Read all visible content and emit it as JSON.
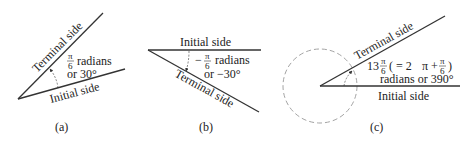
{
  "diagrams": [
    {
      "id": "a",
      "caption": "(a)",
      "terminal_label": "Terminal side",
      "initial_label": "Initial side",
      "angle_frac_num": "π",
      "angle_frac_den": "6",
      "angle_unit": "radians",
      "angle_degrees": "or 30°"
    },
    {
      "id": "b",
      "caption": "(b)",
      "terminal_label": "Terminal side",
      "initial_label": "Initial side",
      "angle_sign": "−",
      "angle_frac_num": "π",
      "angle_frac_den": "6",
      "angle_unit": "radians",
      "angle_degrees": "or −30°"
    },
    {
      "id": "c",
      "caption": "(c)",
      "terminal_label": "Terminal side",
      "initial_label": "Initial side",
      "angle_whole": "13",
      "angle_frac_num": "π",
      "angle_frac_den": "6",
      "angle_equiv_open": "( = 2",
      "angle_equiv_pi": "π",
      "angle_equiv_plus": "+",
      "angle_equiv_frac_num": "π",
      "angle_equiv_frac_den": "6",
      "angle_equiv_close": ")",
      "angle_second_line": "radians or 390°"
    }
  ],
  "colors": {
    "line": "#333333",
    "dashed_circle": "#999999",
    "text": "#222222"
  }
}
